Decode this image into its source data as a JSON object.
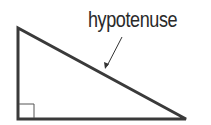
{
  "diagram": {
    "type": "right-triangle",
    "label": "hypotenuse",
    "colors": {
      "stroke": "#3a3a3a",
      "text": "#2a2a2a",
      "background": "#ffffff"
    },
    "triangle": {
      "vertices": [
        [
          18,
          28
        ],
        [
          18,
          119
        ],
        [
          186,
          119
        ]
      ],
      "right_angle_at": [
        18,
        119
      ],
      "right_angle_marker_size": 15
    },
    "arrow": {
      "from": [
        122,
        37
      ],
      "to": [
        106,
        68
      ],
      "points_to": "hypotenuse"
    }
  }
}
